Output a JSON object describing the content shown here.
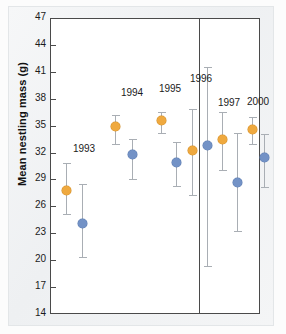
{
  "chart_data": {
    "type": "scatter",
    "title": "",
    "xlabel": "",
    "ylabel": "Mean nestling mass (g)",
    "ylim": [
      14,
      47
    ],
    "ytick_step": 3,
    "yticks": [
      47,
      44,
      41,
      38,
      35,
      32,
      29,
      26,
      23,
      20,
      17,
      14
    ],
    "grid": false,
    "legend": "none",
    "error_bars": "vertical",
    "categories": [
      "1993",
      "1994",
      "1995",
      "1996",
      "1997",
      "2000"
    ],
    "annotations": [
      "1993",
      "1994",
      "1995",
      "1996",
      "1997",
      "2000"
    ],
    "series": [
      {
        "name": "orange",
        "color": "#efa93f",
        "values": [
          27.8,
          34.9,
          35.6,
          32.2,
          33.5,
          34.6
        ],
        "err_low": [
          25.2,
          32.9,
          34.2,
          27.3,
          30.0,
          33.0
        ],
        "err_high": [
          30.8,
          36.2,
          36.5,
          36.9,
          36.5,
          36.0
        ]
      },
      {
        "name": "blue",
        "color": "#7392c6",
        "values": [
          24.1,
          31.8,
          30.9,
          32.8,
          28.7,
          31.4
        ],
        "err_low": [
          20.4,
          29.1,
          28.3,
          19.3,
          23.2,
          28.2
        ],
        "err_high": [
          28.5,
          33.5,
          33.2,
          41.5,
          34.2,
          34.1
        ]
      }
    ]
  },
  "axis": {
    "y_title": "Mean nestling mass (g)",
    "ticks": [
      "47",
      "44",
      "41",
      "38",
      "35",
      "32",
      "29",
      "26",
      "23",
      "20",
      "17",
      "14"
    ]
  },
  "colors": {
    "orange": "#efa93f",
    "blue": "#7392c6",
    "errbar": "#a9aeb4",
    "frame": "#4a4a4a"
  }
}
